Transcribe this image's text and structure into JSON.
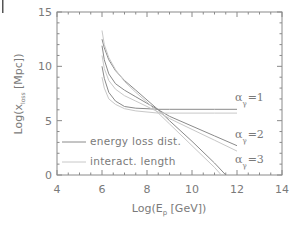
{
  "chart_data": {
    "type": "line",
    "title": "",
    "xlabel": "Log(E_p [GeV])",
    "ylabel": "Log(x_loss [Mpc])",
    "xlim": [
      4,
      14
    ],
    "ylim": [
      0,
      15
    ],
    "xticks": [
      4,
      6,
      8,
      10,
      12,
      14
    ],
    "yticks": [
      0,
      5,
      10,
      15
    ],
    "grid": false,
    "legend_position": "lower-left inside",
    "legend": [
      {
        "label": "energy loss dist.",
        "style": "solid",
        "color": "#8a8a8a"
      },
      {
        "label": "interact. length",
        "style": "solid-light",
        "color": "#c8c8c8"
      }
    ],
    "annotations": [
      {
        "text": "α_γ =1",
        "x": 12.6,
        "y": 6.3
      },
      {
        "text": "α_γ =2",
        "x": 12.6,
        "y": 3.0
      },
      {
        "text": "α_γ =3",
        "x": 12.6,
        "y": 0.6
      }
    ],
    "series": [
      {
        "name": "energy loss dist. α_γ=1",
        "color": "#8a8a8a",
        "x": [
          6.0,
          6.1,
          6.3,
          6.6,
          7.0,
          7.5,
          8.0,
          8.5,
          9.0,
          10.0,
          11.0,
          12.0
        ],
        "y": [
          10.0,
          8.9,
          7.6,
          6.8,
          6.3,
          6.15,
          6.1,
          6.05,
          6.05,
          6.05,
          6.05,
          6.05
        ]
      },
      {
        "name": "energy loss dist. α_γ=2",
        "color": "#8a8a8a",
        "x": [
          6.0,
          6.1,
          6.3,
          6.6,
          7.0,
          7.5,
          8.0,
          8.5,
          9.0,
          10.0,
          11.0,
          12.0
        ],
        "y": [
          11.9,
          10.6,
          9.3,
          8.4,
          7.8,
          7.2,
          6.6,
          6.0,
          5.4,
          4.5,
          3.6,
          2.7
        ]
      },
      {
        "name": "energy loss dist. α_γ=3",
        "color": "#8a8a8a",
        "x": [
          6.0,
          6.1,
          6.3,
          6.6,
          7.0,
          7.5,
          8.0,
          8.5,
          9.0,
          10.0,
          11.0,
          11.5
        ],
        "y": [
          12.5,
          11.7,
          10.6,
          9.6,
          8.7,
          7.8,
          6.9,
          6.0,
          5.0,
          3.1,
          1.1,
          0.0
        ]
      },
      {
        "name": "interact. length α_γ=1",
        "color": "#c8c8c8",
        "x": [
          6.0,
          6.1,
          6.3,
          6.6,
          7.0,
          7.5,
          8.0,
          8.5,
          9.0,
          10.0,
          11.0,
          12.0
        ],
        "y": [
          9.0,
          8.0,
          7.0,
          6.5,
          6.1,
          5.9,
          5.8,
          5.7,
          5.7,
          5.7,
          5.7,
          5.7
        ]
      },
      {
        "name": "interact. length α_γ=2",
        "color": "#c8c8c8",
        "x": [
          6.0,
          6.1,
          6.3,
          6.6,
          7.0,
          7.5,
          8.0,
          8.5,
          9.0,
          10.0,
          11.0,
          12.0
        ],
        "y": [
          11.0,
          9.8,
          8.7,
          7.9,
          7.3,
          6.8,
          6.3,
          5.8,
          5.2,
          4.2,
          3.2,
          2.2
        ]
      },
      {
        "name": "interact. length α_γ=3",
        "color": "#c8c8c8",
        "x": [
          6.0,
          6.1,
          6.3,
          6.6,
          7.0,
          7.5,
          8.0,
          8.5,
          9.0,
          10.0,
          11.0,
          11.3
        ],
        "y": [
          13.3,
          12.0,
          10.8,
          9.7,
          8.6,
          7.6,
          6.7,
          5.7,
          4.7,
          2.7,
          0.7,
          0.0
        ]
      }
    ]
  },
  "axes": {
    "x_tick_labels": [
      "4",
      "6",
      "8",
      "10",
      "12",
      "14"
    ],
    "y_tick_labels": [
      "0",
      "5",
      "10",
      "15"
    ],
    "xlabel_main": "Log(E",
    "xlabel_sub": "p",
    "xlabel_tail": " [GeV])",
    "ylabel_main": "Log(x",
    "ylabel_sub": "loss",
    "ylabel_tail": " [Mpc])"
  },
  "legend": {
    "item1": "energy loss dist.",
    "item2": "interact. length"
  },
  "annotations": {
    "a1_main": "α",
    "a1_sub": "γ",
    "a1_tail": "=1",
    "a2_main": "α",
    "a2_sub": "γ",
    "a2_tail": "=2",
    "a3_main": "α",
    "a3_sub": "γ",
    "a3_tail": "=3"
  },
  "colors": {
    "frame": "#8a8a8a",
    "solid": "#8a8a8a",
    "light": "#c8c8c8",
    "text": "#7a7a7a"
  }
}
